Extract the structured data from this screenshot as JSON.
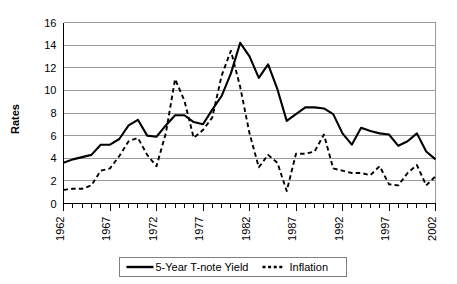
{
  "chart_data": {
    "type": "line",
    "title": "",
    "xlabel": "",
    "ylabel": "Rates",
    "ylim": [
      0,
      16
    ],
    "ytick_step": 2,
    "yticks": [
      0,
      2,
      4,
      6,
      8,
      10,
      12,
      14,
      16
    ],
    "xlim": [
      1962,
      2002
    ],
    "xticks_labeled": [
      1962,
      1967,
      1972,
      1977,
      1982,
      1987,
      1992,
      1997,
      2002
    ],
    "grid": "horizontal",
    "legend_position": "bottom-center",
    "x": [
      1962,
      1963,
      1964,
      1965,
      1966,
      1967,
      1968,
      1969,
      1970,
      1971,
      1972,
      1973,
      1974,
      1975,
      1976,
      1977,
      1978,
      1979,
      1980,
      1981,
      1982,
      1983,
      1984,
      1985,
      1986,
      1987,
      1988,
      1989,
      1990,
      1991,
      1992,
      1993,
      1994,
      1995,
      1996,
      1997,
      1998,
      1999,
      2000,
      2001,
      2002
    ],
    "series": [
      {
        "name": "5-Year T-note Yield",
        "style": "solid",
        "color": "#000000",
        "values": [
          3.6,
          3.9,
          4.1,
          4.3,
          5.2,
          5.2,
          5.7,
          6.9,
          7.4,
          6.0,
          5.9,
          6.9,
          7.8,
          7.8,
          7.2,
          7.0,
          8.3,
          9.5,
          11.5,
          14.2,
          13.0,
          11.1,
          12.3,
          10.1,
          7.3,
          7.9,
          8.5,
          8.5,
          8.4,
          7.9,
          6.2,
          5.2,
          6.7,
          6.4,
          6.2,
          6.1,
          5.1,
          5.5,
          6.2,
          4.6,
          3.9
        ]
      },
      {
        "name": "Inflation",
        "style": "dashed",
        "color": "#000000",
        "values": [
          1.2,
          1.3,
          1.3,
          1.6,
          2.9,
          3.1,
          4.2,
          5.5,
          5.8,
          4.3,
          3.3,
          6.2,
          11.0,
          9.1,
          5.8,
          6.5,
          7.6,
          11.3,
          13.5,
          10.3,
          6.2,
          3.2,
          4.3,
          3.6,
          1.1,
          4.4,
          4.4,
          4.6,
          6.1,
          3.1,
          2.9,
          2.7,
          2.7,
          2.5,
          3.3,
          1.7,
          1.6,
          2.7,
          3.4,
          1.6,
          2.4
        ]
      }
    ]
  },
  "legend": {
    "items": [
      {
        "label": "5-Year T-note Yield",
        "swatch": "solid-line-swatch"
      },
      {
        "label": "Inflation",
        "swatch": "dashed-line-swatch"
      }
    ]
  },
  "axis": {
    "y_title": "Rates",
    "y_ticks": [
      "0",
      "2",
      "4",
      "6",
      "8",
      "10",
      "12",
      "14",
      "16"
    ],
    "x_ticks": [
      "1962",
      "1967",
      "1972",
      "1977",
      "1982",
      "1987",
      "1992",
      "1997",
      "2002"
    ]
  }
}
